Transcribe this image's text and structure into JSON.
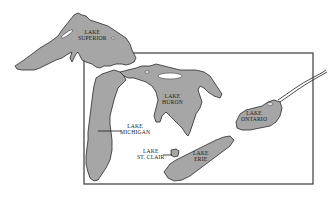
{
  "map": {
    "subject": "Great Lakes",
    "colors": {
      "water": "#a6a6a6",
      "outline": "#2a2a2a",
      "background": "#ffffff",
      "frame": "#3a3a3a"
    },
    "labels": {
      "superior": {
        "line1": "LAKE",
        "line2": "SUPERIOR"
      },
      "huron": {
        "line1": "LAKE",
        "line2": "HURON"
      },
      "michigan": {
        "line1": "LAKE",
        "line2": "MICHIGAN"
      },
      "st_clair": {
        "line1": "LAKE",
        "line2": "ST. CLAIR"
      },
      "erie": {
        "line1": "LAKE",
        "line2": "ERIE"
      },
      "ontario": {
        "line1": "LAKE",
        "line2": "ONTARIO"
      }
    }
  }
}
